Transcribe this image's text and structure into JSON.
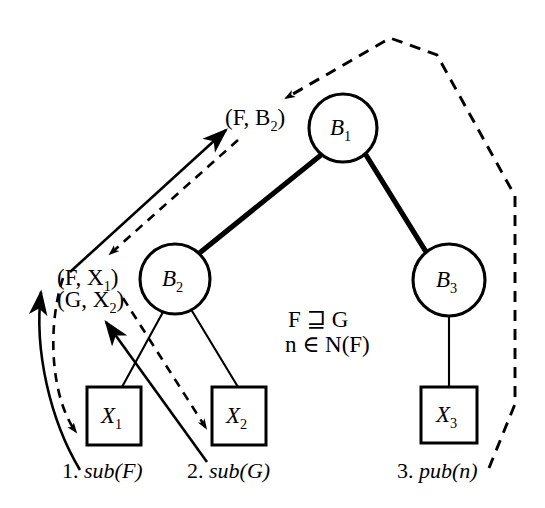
{
  "figure": {
    "type": "tree-diagram-with-message-flow",
    "background_color": "#ffffff",
    "ink_color": "#000000",
    "width": 545,
    "height": 508
  },
  "nodes": {
    "circles": [
      {
        "id": "B1",
        "label": "B",
        "sub": "1",
        "cx": 343,
        "cy": 128,
        "r": 34
      },
      {
        "id": "B2",
        "label": "B",
        "sub": "2",
        "cx": 175,
        "cy": 279,
        "r": 35
      },
      {
        "id": "B3",
        "label": "B",
        "sub": "3",
        "cx": 449,
        "cy": 280,
        "r": 36
      }
    ],
    "boxes": [
      {
        "id": "X1",
        "label": "X",
        "sub": "1",
        "x": 87,
        "y": 387,
        "w": 54,
        "h": 58
      },
      {
        "id": "X2",
        "label": "X",
        "sub": "2",
        "x": 212,
        "y": 387,
        "w": 54,
        "h": 58
      },
      {
        "id": "X3",
        "label": "X",
        "sub": "3",
        "x": 421,
        "y": 387,
        "w": 56,
        "h": 56
      }
    ]
  },
  "edges": [
    {
      "from": "B1",
      "to": "B2",
      "style": "solid-thick"
    },
    {
      "from": "B1",
      "to": "B3",
      "style": "solid-thick"
    },
    {
      "from": "B2",
      "to": "X1",
      "style": "solid-thin"
    },
    {
      "from": "B2",
      "to": "X2",
      "style": "solid-thin"
    },
    {
      "from": "B3",
      "to": "X3",
      "style": "solid-thin"
    }
  ],
  "annotations": {
    "pair_fb2": {
      "text": "(F, B",
      "sub": "2",
      "close": ")",
      "x": 225,
      "y": 106
    },
    "pair_fx1": {
      "text": "(F, X",
      "sub": "1",
      "close": ")",
      "x": 57,
      "y": 266
    },
    "pair_gx2": {
      "text": "(G, X",
      "sub": "2",
      "close": ")",
      "x": 57,
      "y": 288
    },
    "condition_line1": "F ⊒ G",
    "condition_line2": "n ∈ N(F)"
  },
  "steps": [
    {
      "number": "1.",
      "call": "sub(F)",
      "x": 62,
      "y": 460
    },
    {
      "number": "2.",
      "call": "sub(G)",
      "x": 187,
      "y": 460
    },
    {
      "number": "3.",
      "call": "pub(n)",
      "x": 397,
      "y": 460
    }
  ],
  "flows": [
    {
      "id": "sub-F-up",
      "style": "solid",
      "direction": "up-right",
      "desc": "X1 to (F,X1) upward solid arrow"
    },
    {
      "id": "sub-F-down",
      "style": "dashed",
      "direction": "down",
      "desc": "dashed reply down to X1"
    },
    {
      "id": "sub-G-up",
      "style": "solid",
      "direction": "up-left",
      "desc": "X2 to (G,X2) upward solid arrow"
    },
    {
      "id": "sub-G-down",
      "style": "dashed",
      "direction": "down-right",
      "desc": "dashed reply down to X2"
    },
    {
      "id": "prop-up",
      "style": "solid",
      "direction": "up-right",
      "desc": "B2 region up to (F,B2) at B1"
    },
    {
      "id": "prop-down",
      "style": "dashed",
      "direction": "down-left",
      "desc": "dashed reply from B1 down to B2 region"
    },
    {
      "id": "pub-n",
      "style": "dashed",
      "direction": "up-then-left",
      "desc": "pub(n) from X3 around right side to B1"
    }
  ]
}
